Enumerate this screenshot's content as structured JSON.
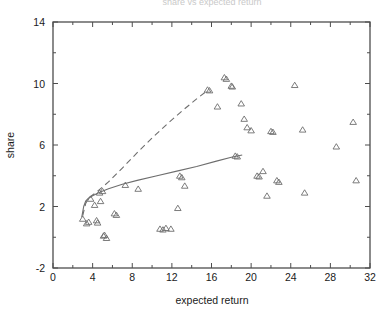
{
  "figure": {
    "background": "#ffffff",
    "cropped_title_fragment": "share vs expected return",
    "frame_color": "#4d4d4d",
    "marker_color": "#6e6e6e",
    "curve_color": "#6e6e6e"
  },
  "chart_data": {
    "type": "scatter",
    "title": "",
    "xlabel": "expected return",
    "ylabel": "share",
    "xlim": [
      0,
      32
    ],
    "ylim": [
      -2,
      14
    ],
    "xticks": [
      0,
      4,
      8,
      12,
      16,
      20,
      24,
      28,
      32
    ],
    "xtick_labels": [
      "0",
      "4",
      "8",
      "12",
      "16",
      "20",
      "24",
      "28",
      "32"
    ],
    "yticks": [
      -2,
      2,
      6,
      10,
      14
    ],
    "ytick_labels": [
      "-2",
      "2",
      "6",
      "10",
      "14"
    ],
    "x_minor_tick_step": 2,
    "y_minor_tick_step": 2,
    "grid": false,
    "legend": "none",
    "marker": "triangle-open",
    "series": [
      {
        "name": "observations",
        "marker": "triangle-open",
        "points": [
          [
            3.0,
            1.2
          ],
          [
            3.4,
            0.9
          ],
          [
            3.6,
            1.0
          ],
          [
            3.8,
            2.5
          ],
          [
            4.2,
            2.1
          ],
          [
            4.4,
            1.1
          ],
          [
            4.5,
            0.95
          ],
          [
            4.7,
            2.9
          ],
          [
            4.8,
            2.35
          ],
          [
            5.0,
            3.0
          ],
          [
            5.1,
            0.1
          ],
          [
            5.2,
            0.15
          ],
          [
            5.4,
            -0.05
          ],
          [
            6.2,
            1.55
          ],
          [
            6.4,
            1.45
          ],
          [
            7.3,
            3.4
          ],
          [
            8.6,
            3.15
          ],
          [
            10.8,
            0.55
          ],
          [
            11.1,
            0.5
          ],
          [
            11.4,
            0.6
          ],
          [
            11.9,
            0.55
          ],
          [
            12.6,
            1.9
          ],
          [
            12.8,
            4.0
          ],
          [
            13.0,
            3.9
          ],
          [
            13.3,
            3.35
          ],
          [
            15.6,
            9.6
          ],
          [
            15.8,
            9.55
          ],
          [
            16.6,
            8.5
          ],
          [
            17.3,
            10.4
          ],
          [
            17.5,
            10.3
          ],
          [
            18.0,
            9.85
          ],
          [
            18.1,
            9.8
          ],
          [
            18.4,
            5.3
          ],
          [
            18.6,
            5.25
          ],
          [
            19.0,
            8.7
          ],
          [
            19.3,
            7.7
          ],
          [
            19.6,
            7.15
          ],
          [
            20.0,
            6.95
          ],
          [
            20.6,
            4.0
          ],
          [
            20.8,
            3.95
          ],
          [
            21.2,
            4.3
          ],
          [
            21.6,
            2.7
          ],
          [
            22.0,
            6.9
          ],
          [
            22.2,
            6.85
          ],
          [
            22.6,
            3.7
          ],
          [
            22.8,
            3.6
          ],
          [
            24.4,
            9.9
          ],
          [
            25.2,
            7.0
          ],
          [
            25.4,
            2.9
          ],
          [
            28.6,
            5.9
          ],
          [
            30.3,
            7.5
          ],
          [
            30.6,
            3.7
          ]
        ]
      }
    ],
    "curves": [
      {
        "name": "upper-dashed-fit",
        "style": "dashed",
        "points": [
          [
            3.0,
            1.4
          ],
          [
            3.3,
            2.2
          ],
          [
            3.6,
            2.55
          ],
          [
            4.0,
            2.75
          ],
          [
            4.6,
            3.05
          ],
          [
            5.6,
            3.6
          ],
          [
            7.0,
            4.5
          ],
          [
            8.5,
            5.5
          ],
          [
            10.0,
            6.45
          ],
          [
            11.5,
            7.35
          ],
          [
            13.0,
            8.2
          ],
          [
            14.5,
            9.0
          ],
          [
            15.6,
            9.55
          ]
        ]
      },
      {
        "name": "lower-solid-fit",
        "style": "solid",
        "points": [
          [
            2.9,
            1.3
          ],
          [
            3.1,
            2.0
          ],
          [
            3.3,
            2.35
          ],
          [
            3.6,
            2.55
          ],
          [
            4.0,
            2.7
          ],
          [
            4.6,
            2.9
          ],
          [
            5.6,
            3.15
          ],
          [
            7.0,
            3.45
          ],
          [
            8.5,
            3.7
          ],
          [
            10.5,
            4.0
          ],
          [
            12.5,
            4.3
          ],
          [
            14.5,
            4.6
          ],
          [
            16.5,
            4.95
          ],
          [
            18.0,
            5.2
          ],
          [
            19.1,
            5.35
          ]
        ]
      }
    ]
  }
}
